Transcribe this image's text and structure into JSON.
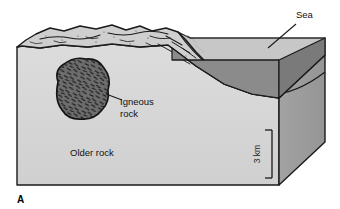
{
  "figure": {
    "panel_label": "A",
    "type": "geologic-block-diagram"
  },
  "labels": {
    "sea": "Sea",
    "igneous_rock_line1": "Igneous",
    "igneous_rock_line2": "rock",
    "older_rock": "Older rock"
  },
  "scale_bar": {
    "value": "3 km"
  },
  "colors": {
    "background": "#ffffff",
    "outline": "#1a1a1a",
    "front_face": "#d6d6d6",
    "right_face": "#9c9c9c",
    "top_land": "#cfcfcf",
    "sea_surface": "#c2c2c2",
    "sea_surface_right": "#b4b4b4",
    "water_body": "#8d8d8d",
    "water_body_right": "#777777",
    "igneous_body": "#6e6e6e",
    "igneous_hatch": "#1a1a1a",
    "contour_line": "#1a1a1a"
  }
}
